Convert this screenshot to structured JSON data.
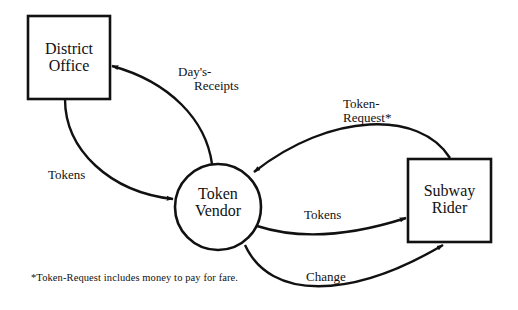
{
  "diagram": {
    "type": "data-flow-diagram",
    "nodes": [
      {
        "id": "district_office",
        "shape": "square",
        "line1": "District",
        "line2": "Office"
      },
      {
        "id": "token_vendor",
        "shape": "circle",
        "line1": "Token",
        "line2": "Vendor"
      },
      {
        "id": "subway_rider",
        "shape": "square",
        "line1": "Subway",
        "line2": "Rider"
      }
    ],
    "flows": [
      {
        "id": "days_receipts",
        "from": "token_vendor",
        "to": "district_office",
        "line1": "Day's-",
        "line2": "Receipts"
      },
      {
        "id": "tokens_in",
        "from": "district_office",
        "to": "token_vendor",
        "line1": "Tokens"
      },
      {
        "id": "token_request",
        "from": "subway_rider",
        "to": "token_vendor",
        "line1": "Token-",
        "line2": "Request*"
      },
      {
        "id": "tokens_out",
        "from": "token_vendor",
        "to": "subway_rider",
        "line1": "Tokens"
      },
      {
        "id": "change",
        "from": "token_vendor",
        "to": "subway_rider",
        "line1": "Change"
      }
    ],
    "footnote": "*Token-Request includes money to pay for fare.",
    "colors": {
      "stroke": "#111111",
      "background": "#ffffff"
    }
  }
}
